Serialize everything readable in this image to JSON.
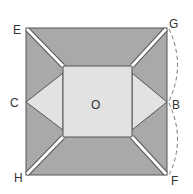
{
  "diagram": {
    "labels": {
      "E": "E",
      "G": "G",
      "C": "C",
      "O": "O",
      "B": "B",
      "H": "H",
      "F": "F"
    },
    "colors": {
      "dark_fill": "#a9a9a9",
      "light_fill": "#e2e2e2",
      "stroke": "#555555",
      "crease": "#ffffff",
      "dashed": "#777777"
    }
  }
}
